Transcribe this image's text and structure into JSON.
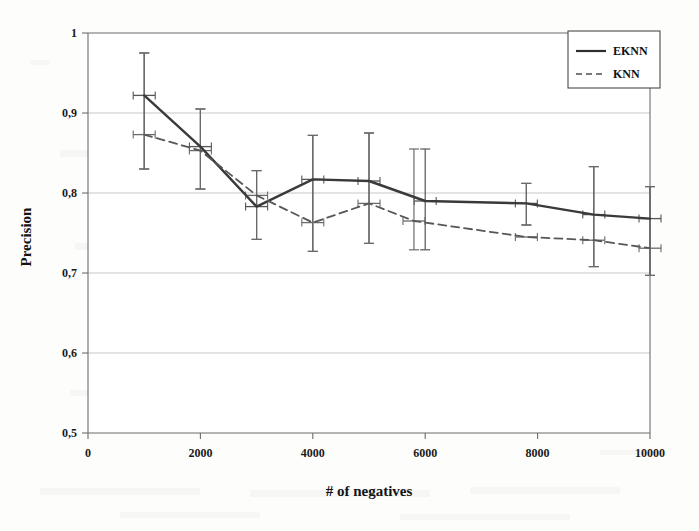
{
  "chart_data": {
    "type": "line",
    "title": "",
    "xlabel": "# of negatives",
    "ylabel": "Precision",
    "xlim": [
      0,
      10000
    ],
    "ylim": [
      0.5,
      1.0
    ],
    "xticks": [
      "0",
      "2000",
      "4000",
      "6000",
      "8000",
      "10000"
    ],
    "xtick_values": [
      0,
      2000,
      4000,
      6000,
      8000,
      10000
    ],
    "yticks": [
      "0,5",
      "0,6",
      "0,7",
      "0,8",
      "0,9",
      "1"
    ],
    "ytick_values": [
      0.5,
      0.6,
      0.7,
      0.8,
      0.9,
      1.0
    ],
    "grid": "horizontal",
    "legend_position": "top-right",
    "decimal_separator": ",",
    "series": [
      {
        "name": "EKNN",
        "style": "solid",
        "color": "#3a3a3a",
        "x": [
          1000,
          2000,
          3000,
          4000,
          5000,
          6000,
          7800,
          9000,
          10000
        ],
        "values": [
          0.922,
          0.858,
          0.783,
          0.817,
          0.815,
          0.79,
          0.787,
          0.773,
          0.768
        ],
        "yerr_low": [
          0.83,
          0.805,
          0.742,
          0.727,
          0.737,
          0.729,
          0.76,
          0.708,
          0.697
        ],
        "yerr_high": [
          0.975,
          0.905,
          0.828,
          0.872,
          0.875,
          0.855,
          0.812,
          0.833,
          0.808
        ]
      },
      {
        "name": "KNN",
        "style": "dashed",
        "color": "#575757",
        "x": [
          1000,
          2000,
          3000,
          4000,
          5000,
          5800,
          7800,
          9000,
          10000
        ],
        "values": [
          0.873,
          0.853,
          0.797,
          0.763,
          0.787,
          0.765,
          0.745,
          0.741,
          0.731
        ],
        "yerr_low": [
          0.83,
          0.805,
          0.742,
          0.727,
          0.737,
          0.729,
          0.76,
          0.708,
          0.697
        ],
        "yerr_high": [
          0.975,
          0.905,
          0.828,
          0.872,
          0.875,
          0.855,
          0.812,
          0.833,
          0.808
        ]
      }
    ]
  },
  "axes": {
    "x_title": "# of negatives",
    "y_title": "Precision"
  },
  "legend": {
    "entries": [
      {
        "label": "EKNN",
        "style": "solid"
      },
      {
        "label": "KNN",
        "style": "dashed"
      }
    ]
  }
}
